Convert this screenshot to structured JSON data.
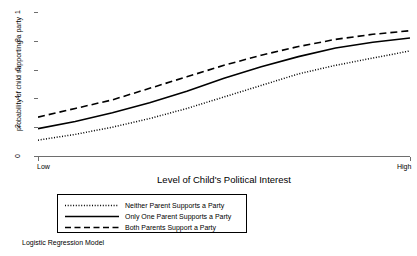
{
  "chart_data": {
    "type": "line",
    "title": "",
    "xlabel": "Level of Child's Political Interest",
    "ylabel": "probability of child supporting a party",
    "note": "Logistic Regression Model",
    "grid": true,
    "legend_position": "below-center",
    "xlim": [
      0,
      1
    ],
    "ylim": [
      0,
      1
    ],
    "x_tick_labels": [
      "Low",
      "High"
    ],
    "x_tick_values": [
      0,
      1
    ],
    "y_tick_labels": [
      "0",
      ".2",
      ".4",
      ".6",
      ".8",
      "1"
    ],
    "y_tick_values": [
      0,
      0.2,
      0.4,
      0.6,
      0.8,
      1
    ],
    "x": [
      0,
      0.1,
      0.2,
      0.3,
      0.4,
      0.5,
      0.6,
      0.7,
      0.8,
      0.9,
      1
    ],
    "series": [
      {
        "name": "Neither Parent Supports a Party",
        "style": "dotted",
        "color": "#000000",
        "values": [
          0.11,
          0.15,
          0.2,
          0.26,
          0.33,
          0.41,
          0.49,
          0.57,
          0.63,
          0.68,
          0.73
        ]
      },
      {
        "name": "Only One Parent Supports a Party",
        "style": "solid",
        "color": "#000000",
        "values": [
          0.19,
          0.24,
          0.3,
          0.37,
          0.45,
          0.54,
          0.62,
          0.69,
          0.75,
          0.79,
          0.82
        ]
      },
      {
        "name": "Both Parents Support a Party",
        "style": "dashed",
        "color": "#000000",
        "values": [
          0.27,
          0.33,
          0.39,
          0.47,
          0.55,
          0.63,
          0.7,
          0.76,
          0.81,
          0.845,
          0.87
        ]
      }
    ]
  },
  "axes": {
    "y_title": "probability of child supporting a party",
    "x_title": "Level of Child's Political Interest",
    "y_ticks": [
      {
        "label": "1",
        "value": 1
      },
      {
        "label": ".8",
        "value": 0.8
      },
      {
        "label": ".6",
        "value": 0.6
      },
      {
        "label": ".4",
        "value": 0.4
      },
      {
        "label": ".2",
        "value": 0.2
      },
      {
        "label": "0",
        "value": 0
      }
    ],
    "x_ticks": [
      {
        "label": "Low",
        "value": 0
      },
      {
        "label": "High",
        "value": 1
      }
    ]
  },
  "legend": {
    "items": [
      {
        "label": "Neither Parent Supports a Party",
        "style": "dotted"
      },
      {
        "label": "Only One Parent Supports a Party",
        "style": "solid"
      },
      {
        "label": "Both Parents Support a Party",
        "style": "dashed"
      }
    ]
  },
  "footnote": {
    "text": "Logistic Regression Model"
  },
  "colors": {
    "line": "#000000",
    "grid": "#e2e2e2",
    "axis": "#6e6e6e",
    "background": "#ffffff"
  }
}
